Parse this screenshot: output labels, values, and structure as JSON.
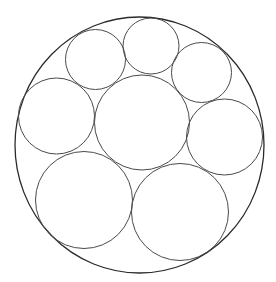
{
  "diagram": {
    "title": "",
    "background": "#ffffff",
    "stroke_color_outer": "#2a2a2a",
    "stroke_color_inner": "#4a4a4a",
    "outer_circle": {
      "cx": 139.5,
      "cy": 145,
      "rx": 124.5,
      "ry": 128
    },
    "inner_circles": [
      {
        "name": "top-left",
        "cx": 95.5,
        "cy": 59.5,
        "r": 30
      },
      {
        "name": "top-middle",
        "cx": 151,
        "cy": 46,
        "r": 28
      },
      {
        "name": "top-right",
        "cx": 201.5,
        "cy": 72.5,
        "r": 30
      },
      {
        "name": "left",
        "cx": 56.5,
        "cy": 116,
        "r": 38
      },
      {
        "name": "center",
        "cx": 142,
        "cy": 122.5,
        "r": 47.5
      },
      {
        "name": "right",
        "cx": 224.5,
        "cy": 137,
        "r": 38
      },
      {
        "name": "bottom-left",
        "cx": 84,
        "cy": 200,
        "r": 48.5
      },
      {
        "name": "bottom-right",
        "cx": 180,
        "cy": 212,
        "r": 48.5
      }
    ]
  }
}
